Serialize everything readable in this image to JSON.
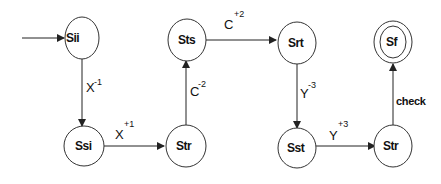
{
  "diagram": {
    "type": "state-machine",
    "nodes": [
      {
        "id": "sii",
        "label": "Sii",
        "start": true,
        "final": false
      },
      {
        "id": "ssi",
        "label": "Ssi",
        "start": false,
        "final": false
      },
      {
        "id": "str1",
        "label": "Str",
        "start": false,
        "final": false
      },
      {
        "id": "sts",
        "label": "Sts",
        "start": false,
        "final": false
      },
      {
        "id": "srt",
        "label": "Srt",
        "start": false,
        "final": false
      },
      {
        "id": "sst",
        "label": "Sst",
        "start": false,
        "final": false
      },
      {
        "id": "str2",
        "label": "Str",
        "start": false,
        "final": false
      },
      {
        "id": "sf",
        "label": "Sf",
        "start": false,
        "final": true
      }
    ],
    "edges": [
      {
        "from": "sii",
        "to": "ssi",
        "base": "X",
        "sup": "-1"
      },
      {
        "from": "ssi",
        "to": "str1",
        "base": "X",
        "sup": "+1"
      },
      {
        "from": "str1",
        "to": "sts",
        "base": "C",
        "sup": "-2"
      },
      {
        "from": "sts",
        "to": "srt",
        "base": "C",
        "sup": "+2"
      },
      {
        "from": "srt",
        "to": "sst",
        "base": "Y",
        "sup": "-3"
      },
      {
        "from": "sst",
        "to": "str2",
        "base": "Y",
        "sup": "+3"
      },
      {
        "from": "str2",
        "to": "sf",
        "base": "check",
        "sup": ""
      }
    ]
  },
  "colors": {
    "stroke": "#333333",
    "background": "#ffffff",
    "text": "#111111"
  }
}
